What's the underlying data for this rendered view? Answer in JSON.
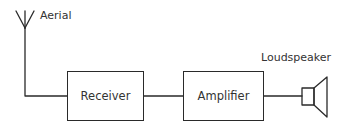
{
  "diagram": {
    "type": "block-diagram",
    "title": "",
    "nodes": [
      {
        "id": "aerial",
        "label": "Aerial",
        "kind": "antenna-symbol"
      },
      {
        "id": "receiver",
        "label": "Receiver",
        "kind": "block"
      },
      {
        "id": "amplifier",
        "label": "Amplifier",
        "kind": "block"
      },
      {
        "id": "loudspeaker",
        "label": "Loudspeaker",
        "kind": "speaker-symbol"
      }
    ],
    "edges": [
      {
        "from": "aerial",
        "to": "receiver"
      },
      {
        "from": "receiver",
        "to": "amplifier"
      },
      {
        "from": "amplifier",
        "to": "loudspeaker"
      }
    ],
    "line_color": "#2a2a2a",
    "background": "#ffffff"
  }
}
